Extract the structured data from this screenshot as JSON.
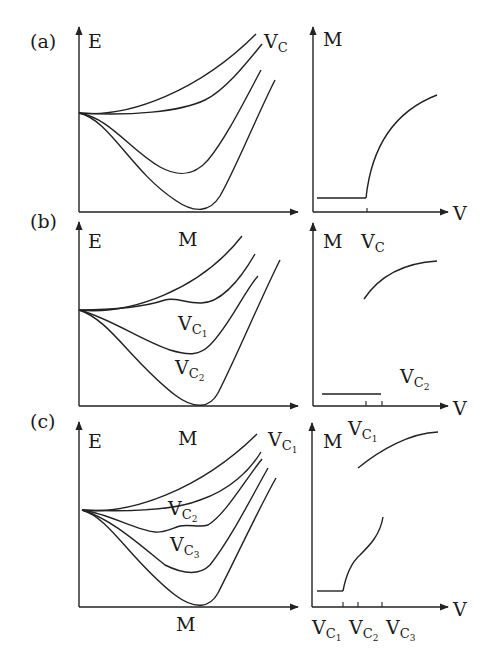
{
  "figure": {
    "panels": [
      {
        "id": "a",
        "label": "(a)",
        "energy_plot": {
          "y_axis": "E",
          "x_axis": "",
          "curve_label": "V",
          "curve_label_sub": "C"
        },
        "magnetization_plot": {
          "y_axis": "M",
          "x_axis": "V",
          "transition": "single continuous onset at V_C"
        }
      },
      {
        "id": "b",
        "label": "(b)",
        "energy_plot": {
          "y_axis": "E",
          "x_axis": "M",
          "curve_labels": [
            {
              "main": "V",
              "sub": "C",
              "subsub": "1"
            },
            {
              "main": "V",
              "sub": "C",
              "subsub": "2"
            }
          ]
        },
        "magnetization_plot": {
          "y_axis": "M",
          "x_axis": "V",
          "top_label": {
            "main": "V",
            "sub": "C"
          },
          "side_label": {
            "main": "V",
            "sub": "C",
            "subsub": "2"
          },
          "transition": "discontinuous jump"
        }
      },
      {
        "id": "c",
        "label": "(c)",
        "energy_plot": {
          "y_axis": "E",
          "x_axis_top": "M",
          "x_axis": "M",
          "curve_labels": [
            {
              "main": "V",
              "sub": "C",
              "subsub": "1"
            },
            {
              "main": "V",
              "sub": "C",
              "subsub": "2"
            },
            {
              "main": "V",
              "sub": "C",
              "subsub": "3"
            }
          ]
        },
        "magnetization_plot": {
          "y_axis": "M",
          "x_axis": "V",
          "top_label": {
            "main": "V",
            "sub": "C",
            "subsub": "1"
          },
          "tick_labels": [
            {
              "main": "V",
              "sub": "C",
              "subsub": "1"
            },
            {
              "main": "V",
              "sub": "C",
              "subsub": "2"
            },
            {
              "main": "V",
              "sub": "C",
              "subsub": "3"
            }
          ],
          "transition": "continuous onset followed by jump"
        }
      }
    ]
  }
}
